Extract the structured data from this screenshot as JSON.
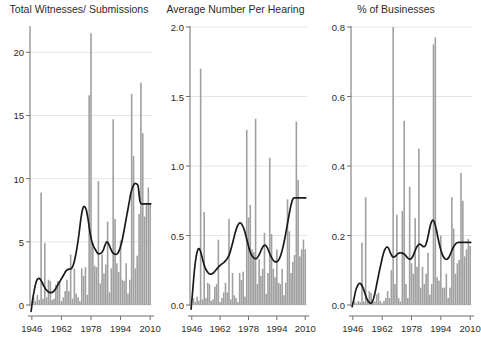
{
  "figure": {
    "width": 479,
    "height": 342,
    "background": "#ffffff",
    "bar_color": "#a0a0a0",
    "line_color": "#1a1a1a",
    "grid_color": "#e2e2e2",
    "axis_color": "#6f6f6f",
    "text_color": "#2b2b2b"
  },
  "chart_data": [
    {
      "type": "bar",
      "panel_index": 0,
      "title": "Total Witnesses/ Submissions",
      "xlabel": "",
      "ylabel": "",
      "xlim": [
        1945,
        2011
      ],
      "ylim": [
        0,
        22
      ],
      "grid": true,
      "legend": "none",
      "yticks": [
        0,
        5,
        10,
        15,
        20
      ],
      "ytick_labels": [
        "0",
        "5",
        "10",
        "15",
        "20"
      ],
      "xticks": [
        1946,
        1962,
        1978,
        1994,
        2010
      ],
      "xtick_labels": [
        "1946",
        "1962",
        "1978",
        "1994",
        "2010"
      ],
      "series": [
        {
          "name": "Total Witnesses/ Submissions",
          "kind": "bar",
          "x": [
            1946,
            1947,
            1948,
            1949,
            1950,
            1951,
            1952,
            1953,
            1954,
            1955,
            1956,
            1957,
            1958,
            1959,
            1960,
            1961,
            1962,
            1963,
            1964,
            1965,
            1966,
            1967,
            1968,
            1969,
            1970,
            1971,
            1972,
            1973,
            1974,
            1975,
            1976,
            1977,
            1978,
            1979,
            1980,
            1981,
            1982,
            1983,
            1984,
            1985,
            1986,
            1987,
            1988,
            1989,
            1990,
            1991,
            1992,
            1993,
            1994,
            1995,
            1996,
            1997,
            1998,
            1999,
            2000,
            2001,
            2002,
            2003,
            2004,
            2005,
            2006,
            2007,
            2008,
            2009,
            2010
          ],
          "values": [
            0,
            0.6,
            0.3,
            0.8,
            0.4,
            8.9,
            0.5,
            4.9,
            0.6,
            2.0,
            1.9,
            0.4,
            0.5,
            1.6,
            1.9,
            1.9,
            0.3,
            0.6,
            1.1,
            2.0,
            1.1,
            4.0,
            0.5,
            2.9,
            0.9,
            0.6,
            0.3,
            2.9,
            2.3,
            3.0,
            0.8,
            16.6,
            21.5,
            4.9,
            3.1,
            3.0,
            9.8,
            1.7,
            4.0,
            2.5,
            3.2,
            6.6,
            1.0,
            2.9,
            14.7,
            6.8,
            3.3,
            2.6,
            5.1,
            2.0,
            1.9,
            3.3,
            0.9,
            2.0,
            16.7,
            11.8,
            2.9,
            3.9,
            7.2,
            17.6,
            13.6,
            7.0,
            8.0,
            9.3,
            8.0
          ]
        },
        {
          "name": "Smoothed trend",
          "kind": "line",
          "x": [
            1945.6,
            1946.5,
            1947.5,
            1948.5,
            1949.5,
            1950.5,
            1951.5,
            1952.5,
            1953.5,
            1954.5,
            1955.5,
            1956.5,
            1957.5,
            1958.5,
            1959.5,
            1960.5,
            1961.5,
            1962.5,
            1963.5,
            1964.5,
            1965.5,
            1966.5,
            1967.5,
            1968.5,
            1969.5,
            1970.5,
            1971.5,
            1972.5,
            1973.5,
            1974.5,
            1975.5,
            1976.5,
            1977.5,
            1978.5,
            1979.5,
            1980.5,
            1981.5,
            1982.5,
            1983.5,
            1984.5,
            1985.5,
            1986.5,
            1987.5,
            1988.5,
            1989.5,
            1990.5,
            1991.5,
            1992.5,
            1993.5,
            1994.5,
            1995.5,
            1996.5,
            1997.5,
            1998.5,
            1999.5,
            2000.5,
            2001.5,
            2002.5,
            2003.5,
            2004.5,
            2005.5,
            2006.5,
            2007.5,
            2008.5,
            2009.5,
            2010.3
          ],
          "values": [
            -0.5,
            0.5,
            1.3,
            1.9,
            2.1,
            2.05,
            1.8,
            1.5,
            1.25,
            1.1,
            1.0,
            0.98,
            1.05,
            1.2,
            1.45,
            1.7,
            1.95,
            2.2,
            2.45,
            2.7,
            2.8,
            2.85,
            2.9,
            3.2,
            3.8,
            4.6,
            5.6,
            6.8,
            7.6,
            7.8,
            7.5,
            6.7,
            5.7,
            5.0,
            4.6,
            4.35,
            4.1,
            4.05,
            4.1,
            4.3,
            4.7,
            5.0,
            4.85,
            4.5,
            4.2,
            4.05,
            4.0,
            4.1,
            4.4,
            4.9,
            5.6,
            6.4,
            7.2,
            8.0,
            8.8,
            9.3,
            9.6,
            9.6,
            9.4,
            8.2,
            8.0,
            8.0,
            8.0,
            8.0,
            8.0,
            8.0
          ]
        }
      ]
    },
    {
      "type": "bar",
      "panel_index": 1,
      "title": "Average Number Per Hearing",
      "xlabel": "",
      "ylabel": "",
      "xlim": [
        1945,
        2011
      ],
      "ylim": [
        0,
        2.0
      ],
      "grid": true,
      "legend": "none",
      "yticks": [
        0.0,
        0.5,
        1.0,
        1.5,
        2.0
      ],
      "ytick_labels": [
        "0.0",
        "0.5",
        "1.0",
        "1.5",
        "2.0"
      ],
      "xticks": [
        1946,
        1962,
        1978,
        1994,
        2010
      ],
      "xtick_labels": [
        "1946",
        "1962",
        "1978",
        "1994",
        "2010"
      ],
      "series": [
        {
          "name": "Average Number Per Hearing",
          "kind": "bar",
          "x": [
            1946,
            1947,
            1948,
            1949,
            1950,
            1951,
            1952,
            1953,
            1954,
            1955,
            1956,
            1957,
            1958,
            1959,
            1960,
            1961,
            1962,
            1963,
            1964,
            1965,
            1966,
            1967,
            1968,
            1969,
            1970,
            1971,
            1972,
            1973,
            1974,
            1975,
            1976,
            1977,
            1978,
            1979,
            1980,
            1981,
            1982,
            1983,
            1984,
            1985,
            1986,
            1987,
            1988,
            1989,
            1990,
            1991,
            1992,
            1993,
            1994,
            1995,
            1996,
            1997,
            1998,
            1999,
            2000,
            2001,
            2002,
            2003,
            2004,
            2005,
            2006,
            2007,
            2008,
            2009,
            2010
          ],
          "values": [
            0,
            0.05,
            0.02,
            0.06,
            0.03,
            1.7,
            0.04,
            0.67,
            0.05,
            0.16,
            0.15,
            0.03,
            0.04,
            0.13,
            0.15,
            0.47,
            0.02,
            0.05,
            0.09,
            0.16,
            0.09,
            0.62,
            0.04,
            0.23,
            0.07,
            0.05,
            0.02,
            0.23,
            0.18,
            0.24,
            0.06,
            1.26,
            0.63,
            0.72,
            0.4,
            0.38,
            1.34,
            0.15,
            0.33,
            0.21,
            0.26,
            0.52,
            0.08,
            0.23,
            1.06,
            0.51,
            0.26,
            0.2,
            0.4,
            0.16,
            0.15,
            0.26,
            0.07,
            0.16,
            0.76,
            0.53,
            0.23,
            0.31,
            0.36,
            1.32,
            0.9,
            0.35,
            0.4,
            0.47,
            0.4
          ]
        },
        {
          "name": "Smoothed trend",
          "kind": "line",
          "x": [
            1945.6,
            1946.5,
            1947.5,
            1948.5,
            1949.5,
            1950.5,
            1951.5,
            1952.5,
            1953.5,
            1954.5,
            1955.5,
            1956.5,
            1957.5,
            1958.5,
            1959.5,
            1960.5,
            1961.5,
            1962.5,
            1963.5,
            1964.5,
            1965.5,
            1966.5,
            1967.5,
            1968.5,
            1969.5,
            1970.5,
            1971.5,
            1972.5,
            1973.5,
            1974.5,
            1975.5,
            1976.5,
            1977.5,
            1978.5,
            1979.5,
            1980.5,
            1981.5,
            1982.5,
            1983.5,
            1984.5,
            1985.5,
            1986.5,
            1987.5,
            1988.5,
            1989.5,
            1990.5,
            1991.5,
            1992.5,
            1993.5,
            1994.5,
            1995.5,
            1996.5,
            1997.5,
            1998.5,
            1999.5,
            2000.5,
            2001.5,
            2002.5,
            2003.5,
            2004.5,
            2005.5,
            2006.5,
            2007.5,
            2008.5,
            2009.5,
            2010.3
          ],
          "values": [
            -0.03,
            0.1,
            0.25,
            0.35,
            0.4,
            0.4,
            0.36,
            0.31,
            0.27,
            0.245,
            0.228,
            0.222,
            0.225,
            0.235,
            0.25,
            0.265,
            0.28,
            0.29,
            0.3,
            0.31,
            0.325,
            0.345,
            0.375,
            0.42,
            0.47,
            0.52,
            0.56,
            0.585,
            0.59,
            0.575,
            0.545,
            0.5,
            0.45,
            0.4,
            0.365,
            0.345,
            0.335,
            0.335,
            0.35,
            0.375,
            0.405,
            0.425,
            0.43,
            0.415,
            0.385,
            0.355,
            0.33,
            0.315,
            0.31,
            0.315,
            0.335,
            0.37,
            0.42,
            0.48,
            0.55,
            0.62,
            0.69,
            0.745,
            0.77,
            0.77,
            0.77,
            0.77,
            0.77,
            0.77,
            0.77,
            0.77
          ]
        }
      ]
    },
    {
      "type": "bar",
      "panel_index": 2,
      "title": "% of Businesses",
      "xlabel": "",
      "ylabel": "",
      "xlim": [
        1945,
        2011
      ],
      "ylim": [
        0,
        0.8
      ],
      "grid": true,
      "legend": "none",
      "yticks": [
        0.0,
        0.2,
        0.4,
        0.6,
        0.8
      ],
      "ytick_labels": [
        "0.0",
        "0.2",
        "0.4",
        "0.6",
        "0.8"
      ],
      "xticks": [
        1946,
        1962,
        1978,
        1994,
        2010
      ],
      "xtick_labels": [
        "1946",
        "1962",
        "1978",
        "1994",
        "2010"
      ],
      "series": [
        {
          "name": "% of Businesses",
          "kind": "bar",
          "x": [
            1946,
            1947,
            1948,
            1949,
            1950,
            1951,
            1952,
            1953,
            1954,
            1955,
            1956,
            1957,
            1958,
            1959,
            1960,
            1961,
            1962,
            1963,
            1964,
            1965,
            1966,
            1967,
            1968,
            1969,
            1970,
            1971,
            1972,
            1973,
            1974,
            1975,
            1976,
            1977,
            1978,
            1979,
            1980,
            1981,
            1982,
            1983,
            1984,
            1985,
            1986,
            1987,
            1988,
            1989,
            1990,
            1991,
            1992,
            1993,
            1994,
            1995,
            1996,
            1997,
            1998,
            1999,
            2000,
            2001,
            2002,
            2003,
            2004,
            2005,
            2006,
            2007,
            2008,
            2009,
            2010
          ],
          "values": [
            0,
            0.01,
            0.005,
            0.012,
            0.008,
            0.18,
            0.01,
            0.31,
            0.012,
            0.04,
            0.035,
            0.008,
            0.01,
            0.03,
            0.035,
            0.012,
            0.005,
            0.012,
            0.02,
            0.04,
            0.02,
            0.1,
            0.8,
            0.06,
            0.26,
            0.02,
            0.01,
            0.27,
            0.53,
            0.06,
            0.02,
            0.34,
            0.12,
            0.09,
            0.25,
            0.11,
            0.45,
            0.05,
            0.11,
            0.06,
            0.09,
            0.15,
            0.03,
            0.06,
            0.75,
            0.77,
            0.08,
            0.07,
            0.2,
            0.05,
            0.05,
            0.09,
            0.02,
            0.05,
            0.31,
            0.22,
            0.09,
            0.12,
            0.13,
            0.38,
            0.3,
            0.14,
            0.16,
            0.19,
            0.17
          ]
        },
        {
          "name": "Smoothed trend",
          "kind": "line",
          "x": [
            1945.6,
            1946.5,
            1947.5,
            1948.5,
            1949.5,
            1950.5,
            1951.5,
            1952.5,
            1953.5,
            1954.5,
            1955.5,
            1956.5,
            1957.5,
            1958.5,
            1959.5,
            1960.5,
            1961.5,
            1962.5,
            1963.5,
            1964.5,
            1965.5,
            1966.5,
            1967.5,
            1968.5,
            1969.5,
            1970.5,
            1971.5,
            1972.5,
            1973.5,
            1974.5,
            1975.5,
            1976.5,
            1977.5,
            1978.5,
            1979.5,
            1980.5,
            1981.5,
            1982.5,
            1983.5,
            1984.5,
            1985.5,
            1986.5,
            1987.5,
            1988.5,
            1989.5,
            1990.5,
            1991.5,
            1992.5,
            1993.5,
            1994.5,
            1995.5,
            1996.5,
            1997.5,
            1998.5,
            1999.5,
            2000.5,
            2001.5,
            2002.5,
            2003.5,
            2004.5,
            2005.5,
            2006.5,
            2007.5,
            2008.5,
            2009.5,
            2010.3
          ],
          "values": [
            -0.005,
            0.015,
            0.04,
            0.055,
            0.062,
            0.06,
            0.05,
            0.035,
            0.02,
            0.01,
            0.005,
            0.008,
            0.022,
            0.045,
            0.072,
            0.098,
            0.122,
            0.145,
            0.16,
            0.167,
            0.163,
            0.15,
            0.14,
            0.138,
            0.142,
            0.147,
            0.15,
            0.15,
            0.148,
            0.144,
            0.138,
            0.133,
            0.132,
            0.138,
            0.15,
            0.163,
            0.172,
            0.175,
            0.172,
            0.168,
            0.17,
            0.185,
            0.21,
            0.233,
            0.244,
            0.238,
            0.218,
            0.192,
            0.168,
            0.15,
            0.138,
            0.132,
            0.132,
            0.138,
            0.15,
            0.163,
            0.172,
            0.178,
            0.18,
            0.18,
            0.18,
            0.18,
            0.18,
            0.18,
            0.18,
            0.18
          ]
        }
      ]
    }
  ]
}
